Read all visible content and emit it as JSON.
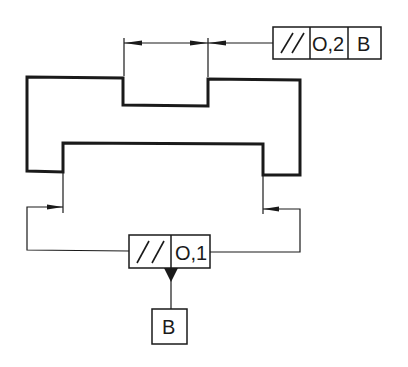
{
  "diagram": {
    "type": "GD&T parallelism tolerance drawing",
    "colors": {
      "line": "#1a1a1a",
      "background": "#ffffff"
    },
    "top_frame": {
      "symbol": "parallelism",
      "symbol_glyph": "//",
      "tolerance": "O,2",
      "datum_ref": "B"
    },
    "bottom_frame": {
      "symbol": "parallelism",
      "symbol_glyph": "//",
      "tolerance": "O,1"
    },
    "datum_feature": {
      "label": "B"
    }
  }
}
